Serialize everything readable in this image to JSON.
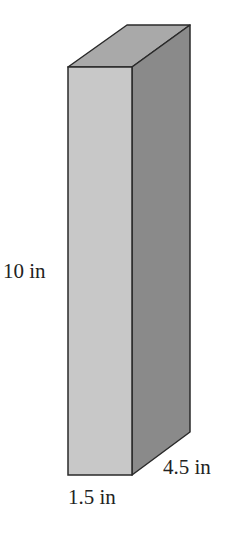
{
  "figure": {
    "shape": "rectangular prism",
    "labels": {
      "height": "10 in",
      "width": "1.5 in",
      "depth": "4.5 in"
    },
    "colors": {
      "front_face": "#c8c8c8",
      "side_face": "#8a8a8a",
      "top_face": "#a9a9a9",
      "edge": "#2a2a2a"
    }
  }
}
